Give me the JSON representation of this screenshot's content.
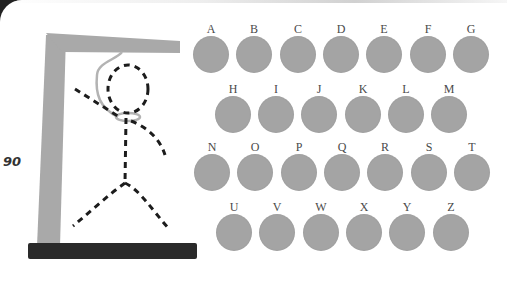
{
  "game": {
    "score": "90",
    "colors": {
      "key_disc": "#a4a4a4",
      "key_label": "#4a4a4a",
      "gallows": "#a9a9a9",
      "base": "#2a2a2a",
      "figure": "#1c1c1c",
      "rope": "#b3b3b3"
    }
  },
  "keyboard": {
    "rows": [
      [
        "A",
        "B",
        "C",
        "D",
        "E",
        "F",
        "G"
      ],
      [
        "H",
        "I",
        "J",
        "K",
        "L",
        "M"
      ],
      [
        "N",
        "O",
        "P",
        "Q",
        "R",
        "S",
        "T"
      ],
      [
        "U",
        "V",
        "W",
        "X",
        "Y",
        "Z"
      ]
    ],
    "keys": {
      "A": "A",
      "B": "B",
      "C": "C",
      "D": "D",
      "E": "E",
      "F": "F",
      "G": "G",
      "H": "H",
      "I": "I",
      "J": "J",
      "K": "K",
      "L": "L",
      "M": "M",
      "N": "N",
      "O": "O",
      "P": "P",
      "Q": "Q",
      "R": "R",
      "S": "S",
      "T": "T",
      "U": "U",
      "V": "V",
      "W": "W",
      "X": "X",
      "Y": "Y",
      "Z": "Z"
    }
  },
  "hangman": {
    "parts_drawn": [
      "head",
      "body",
      "left-arm",
      "right-arm",
      "left-leg",
      "right-leg",
      "rope"
    ]
  }
}
